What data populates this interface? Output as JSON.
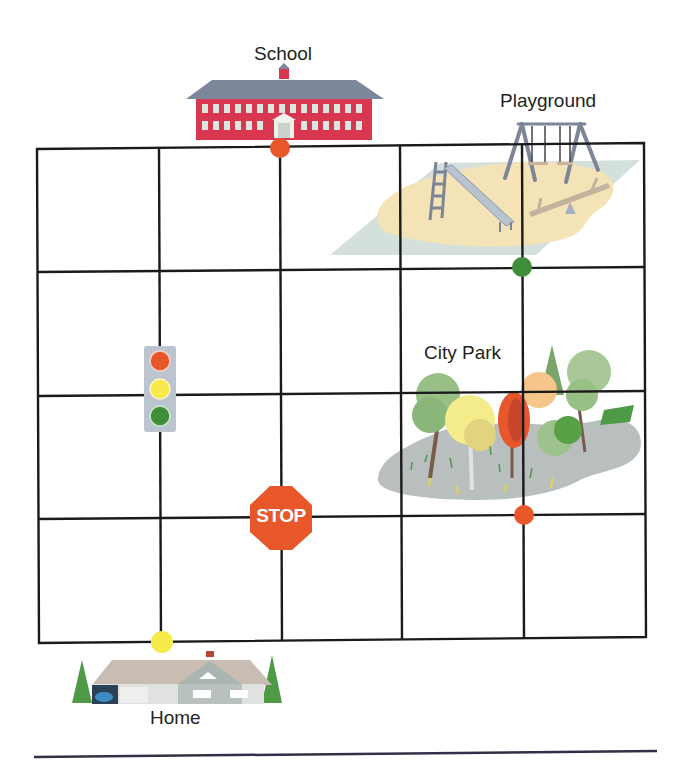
{
  "map": {
    "labels": {
      "school": "School",
      "playground": "Playground",
      "city_park": "City Park",
      "home": "Home"
    },
    "stop_sign_text": "STOP",
    "grid": {
      "columns": 5,
      "rows": 4
    },
    "markers": [
      {
        "name": "school-marker",
        "color": "#e8572a"
      },
      {
        "name": "playground-marker",
        "color": "#3f8f3a"
      },
      {
        "name": "park-marker",
        "color": "#e8572a"
      },
      {
        "name": "home-marker",
        "color": "#f7ea4a"
      }
    ],
    "colors": {
      "grid_line": "#1a1a1a",
      "school_brick": "#d8374f",
      "school_roof": "#7d879c",
      "sand": "#f5e3b8",
      "playground_mat": "#d3e0dc",
      "stop_red": "#e8572a",
      "traffic_red": "#e8572a",
      "traffic_yellow": "#f7ea4a",
      "traffic_green": "#3f8f3a",
      "footer_rule": "#2e3145"
    }
  }
}
